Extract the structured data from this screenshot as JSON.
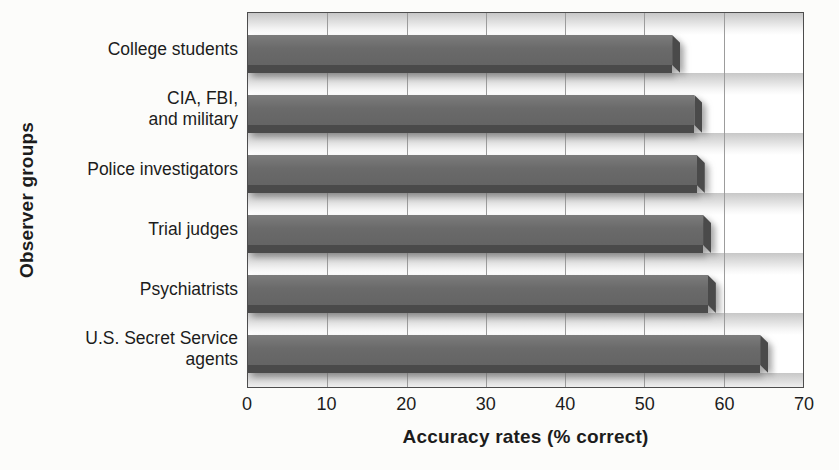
{
  "chart_data": {
    "type": "bar",
    "orientation": "horizontal",
    "xlabel": "Accuracy rates (% correct)",
    "ylabel": "Observer groups",
    "xlim": [
      0,
      70
    ],
    "xticks": [
      0,
      10,
      20,
      30,
      40,
      50,
      60,
      70
    ],
    "grid": "vertical gridlines at every 10 units",
    "legend": "none",
    "categories": [
      "College students",
      "CIA, FBI, and military",
      "Police investigators",
      "Trial judges",
      "Psychiatrists",
      "U.S. Secret Service agents"
    ],
    "category_label_lines": [
      [
        "College students"
      ],
      [
        "CIA, FBI,",
        "and military"
      ],
      [
        "Police investigators"
      ],
      [
        "Trial judges"
      ],
      [
        "Psychiatrists"
      ],
      [
        "U.S. Secret Service",
        "agents"
      ]
    ],
    "values": [
      53.5,
      56.3,
      56.6,
      57.4,
      58,
      64.6
    ]
  },
  "colors": {
    "page_bg": "#fcfcfa",
    "text": "#1c1c1c",
    "bar_face": "#6a6a6a",
    "bar_dark": "#4a4a4a",
    "plot_border": "#4d4d4d",
    "gridline": "#9c9c9c",
    "row_top": "#c7c7c7",
    "row_bottom": "#ffffff"
  }
}
